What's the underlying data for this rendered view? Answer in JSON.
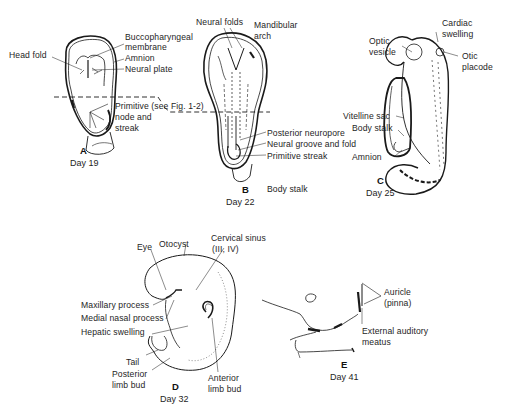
{
  "header": {
    "clipped_text": "· · · · · · · · · · · · · ·"
  },
  "panels": {
    "A": {
      "letter": "A",
      "day": "Day 19",
      "labels": {
        "head_fold": "Head fold",
        "buccopharyngeal_1": "Buccopharyngeal",
        "buccopharyngeal_2": "membrane",
        "amnion": "Amnion",
        "neural_plate": "Neural plate",
        "primitive_1": "Primitive (see Fig. 1-2)",
        "primitive_2": "node and",
        "primitive_3": "streak"
      }
    },
    "B": {
      "letter": "B",
      "day": "Day 22",
      "labels": {
        "neural_folds": "Neural folds",
        "mandibular_1": "Mandibular",
        "mandibular_2": "arch",
        "posterior_neuropore": "Posterior neuropore",
        "neural_groove": "Neural groove and fold",
        "primitive_streak": "Primitive streak",
        "body_stalk": "Body stalk"
      }
    },
    "C": {
      "letter": "C",
      "day": "Day 25",
      "labels": {
        "cardiac_1": "Cardiac",
        "cardiac_2": "swelling",
        "optic_1": "Optic",
        "optic_2": "vesicle",
        "otic_1": "Otic",
        "otic_2": "placode",
        "vitelline_sac": "Vitelline sac",
        "body_stalk": "Body stalk",
        "amnion": "Amnion"
      }
    },
    "D": {
      "letter": "D",
      "day": "Day 32",
      "labels": {
        "eye": "Eye",
        "otocyst": "Otocyst",
        "cervical_1": "Cervical sinus",
        "cervical_2": "(III, IV)",
        "maxillary": "Maxillary process",
        "medial_nasal": "Medial nasal process",
        "hepatic": "Hepatic swelling",
        "tail": "Tail",
        "posterior_1": "Posterior",
        "posterior_2": "limb bud",
        "anterior_1": "Anterior",
        "anterior_2": "limb bud"
      }
    },
    "E": {
      "letter": "E",
      "day": "Day 41",
      "labels": {
        "auricle_1": "Auricle",
        "auricle_2": "(pinna)",
        "external_1": "External auditory",
        "external_2": "meatus"
      }
    }
  }
}
